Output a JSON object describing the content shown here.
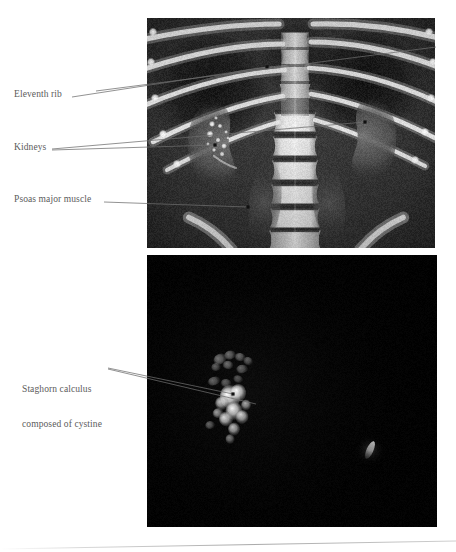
{
  "figure": {
    "kind": "medical-imaging-figure",
    "panels": [
      {
        "name": "coronal-ct-abdomen",
        "modality": "CT",
        "view": "coronal reformat",
        "background": "#2b2b2b"
      },
      {
        "name": "three-dimensional-stone-rendering",
        "modality": "CT",
        "view": "maximum intensity projection",
        "background": "#030303"
      }
    ]
  },
  "annotations": [
    {
      "id": "eleventh-rib",
      "text": "Eleventh rib",
      "lines": [
        "Eleventh rib"
      ],
      "label_x": 14,
      "label_y": 89,
      "leaders": [
        {
          "x1": 72,
          "y1": 97,
          "x2": 267,
          "y2": 67,
          "dot": true
        },
        {
          "x1": 96,
          "y1": 91,
          "x2": 436,
          "y2": 47,
          "dot": false
        }
      ]
    },
    {
      "id": "kidneys",
      "text": "Kidneys",
      "lines": [
        "Kidneys"
      ],
      "label_x": 14,
      "label_y": 142,
      "leaders": [
        {
          "x1": 52,
          "y1": 150,
          "x2": 215,
          "y2": 145,
          "dot": true
        },
        {
          "x1": 52,
          "y1": 149,
          "x2": 365,
          "y2": 122,
          "dot": true
        }
      ]
    },
    {
      "id": "psoas-major-muscle",
      "text": "Psoas major muscle",
      "lines": [
        "Psoas major muscle"
      ],
      "label_x": 14,
      "label_y": 194,
      "leaders": [
        {
          "x1": 104,
          "y1": 202,
          "x2": 248,
          "y2": 207,
          "dot": true
        }
      ]
    },
    {
      "id": "staghorn-calculus",
      "text": "Staghorn calculus composed of cystine",
      "lines": [
        "Staghorn calculus",
        "composed of cystine"
      ],
      "label_x": 22,
      "label_y": 361,
      "leaders": [
        {
          "x1": 108,
          "y1": 368,
          "x2": 233,
          "y2": 394,
          "dot": true
        },
        {
          "x1": 108,
          "y1": 369,
          "x2": 256,
          "y2": 404,
          "dot": false
        }
      ]
    }
  ],
  "colors": {
    "page_background": "#ffffff",
    "label_text": "#5b5b5b",
    "leader_line": "#6d6d6d",
    "leader_dot": "#101010",
    "rule": "#b9b9b9",
    "ct_panel_background": "#2b2b2b",
    "mip_panel_background": "#030303",
    "bone_bright": "#f2f2f2",
    "stone_bright": "#f6f6f6"
  },
  "layout": {
    "width": 456,
    "height": 552,
    "ct_panel": {
      "x": 147,
      "y": 18,
      "w": 288,
      "h": 230
    },
    "mip_panel": {
      "x": 147,
      "y": 255,
      "w": 290,
      "h": 272
    },
    "bottom_rule": {
      "x1": 0,
      "y1": 549,
      "x2": 456,
      "y2": 541
    }
  },
  "ct_scene": {
    "spine_center_x": 148,
    "vertebra_count": 6,
    "rib_pairs": 5,
    "right_kidney": {
      "cx": 70,
      "cy": 128,
      "rx": 36,
      "ry": 45
    },
    "left_kidney": {
      "cx": 222,
      "cy": 122,
      "rx": 34,
      "ry": 44
    },
    "calculus_cluster": {
      "cx": 73,
      "cy": 120
    }
  },
  "mip_scene": {
    "staghorn": {
      "cx": 85,
      "cy": 140
    },
    "small_stone": {
      "cx": 223,
      "cy": 195
    }
  }
}
